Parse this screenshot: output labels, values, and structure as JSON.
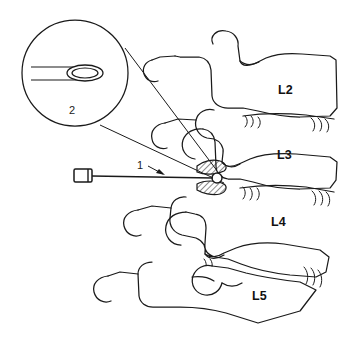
{
  "figure": {
    "background_color": "#ffffff",
    "line_color": "#1a1a1a",
    "width": 349,
    "height": 358
  },
  "labels": {
    "callout_1": "1",
    "callout_2": "2",
    "vertebra_l2": "L2",
    "vertebra_l3": "L3",
    "vertebra_l4": "L4",
    "vertebra_l5": "L5"
  },
  "label_positions": {
    "callout_1": {
      "x": 140,
      "y": 166
    },
    "callout_2": {
      "x": 72,
      "y": 111
    },
    "vertebra_l2": {
      "x": 278,
      "y": 91
    },
    "vertebra_l3": {
      "x": 277,
      "y": 156
    },
    "vertebra_l4": {
      "x": 271,
      "y": 223
    },
    "vertebra_l5": {
      "x": 252,
      "y": 297
    }
  },
  "magnifier": {
    "name": "magnified-inset",
    "center_x": 75,
    "center_y": 73,
    "radius": 53,
    "content": "needle-tip-with-elliptical-bevel-opening"
  },
  "needle": {
    "name": "injection-needle",
    "hub_x": 76,
    "hub_y": 176,
    "tip_x": 216,
    "tip_y": 178
  },
  "target_site": {
    "name": "facet-joint-target",
    "x": 216,
    "y": 178,
    "description": "needle tip at facet joint between hatched articular surfaces"
  }
}
